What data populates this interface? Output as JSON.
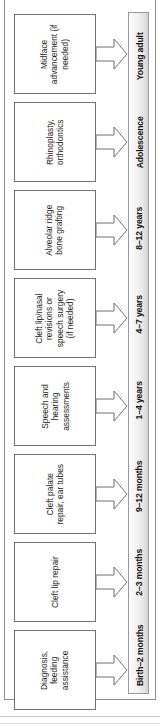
{
  "diagram": {
    "type": "vertical-timeline",
    "orientation": "rotated-90-ccw",
    "arrow_icon_name": "right-block-arrow",
    "colors": {
      "box_border": "#6f6f6f",
      "box_fill": "#ffffff",
      "stage_bar_fill": "#f0f0f0",
      "stage_bar_border": "#9a9a9a",
      "frame_border": "#8d8d8d",
      "text": "#1a1a1a"
    },
    "steps": [
      {
        "id": "birth-2-months",
        "stage": "Birth–2 months",
        "treatment": "Diagnosis, feeding assistance"
      },
      {
        "id": "2-3-months",
        "stage": "2–3 months",
        "treatment": "Cleft lip repair"
      },
      {
        "id": "9-12-months",
        "stage": "9–12 months",
        "treatment": "Cleft palate repair, ear tubes"
      },
      {
        "id": "1-4-years",
        "stage": "1–4 years",
        "treatment": "Speech and hearing assessments"
      },
      {
        "id": "4-7-years",
        "stage": "4–7 years",
        "treatment": "Cleft lip/nasal revisions or speech surgery (if needed)"
      },
      {
        "id": "8-12-years",
        "stage": "8–12 years",
        "treatment": "Alveolar ridge bone grafting"
      },
      {
        "id": "adolescence",
        "stage": "Adolescence",
        "treatment": "Rhinoplasty, orthodontics"
      },
      {
        "id": "young-adult",
        "stage": "Young adult",
        "treatment": "Midface advancement (if needed)"
      }
    ]
  }
}
